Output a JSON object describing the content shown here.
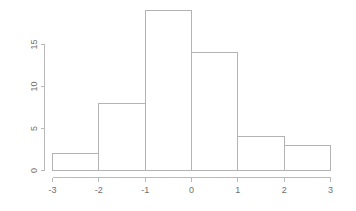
{
  "chart_data": {
    "type": "bar",
    "title": "",
    "subtitle": "",
    "xlabel": "",
    "ylabel": "",
    "categories": [
      "-3 to -2",
      "-2 to -1",
      "-1 to 0",
      "0 to 1",
      "1 to 2",
      "2 to 3"
    ],
    "bin_edges": [
      -3,
      -2,
      -1,
      0,
      1,
      2,
      3
    ],
    "values": [
      2,
      8,
      19,
      14,
      4,
      3
    ],
    "x_tick_labels": [
      "-3",
      "-2",
      "-1",
      "0",
      "1",
      "2",
      "3"
    ],
    "x_tick_values": [
      -3,
      -2,
      -1,
      0,
      1,
      2,
      3
    ],
    "y_tick_labels": [
      "0",
      "5",
      "10",
      "15"
    ],
    "y_tick_values": [
      0,
      5,
      10,
      15
    ],
    "xlim": [
      -3,
      3
    ],
    "ylim": [
      0,
      19
    ],
    "y_axis_range": [
      0,
      15
    ],
    "grid": false,
    "legend": false,
    "bar_fill_color": "#ffffff",
    "bar_stroke_color": "#b3b3b3",
    "axis_color": "#b9b9b9",
    "label_color": "#6f6f6f",
    "background_color": "#ffffff",
    "y_tick_label_rotation": -90
  }
}
